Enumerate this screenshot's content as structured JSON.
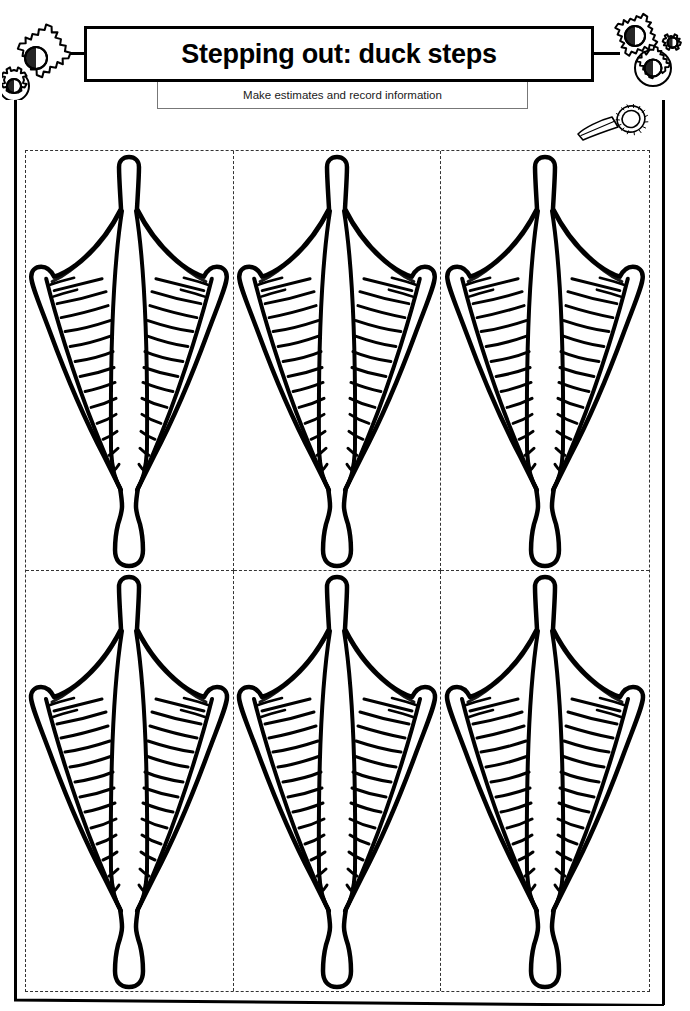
{
  "page": {
    "title": "Stepping out: duck steps",
    "subtitle": "Make estimates and record information",
    "background_color": "#ffffff",
    "ink_color": "#000000",
    "dash_color": "#333333"
  },
  "header": {
    "title": "Stepping out: duck steps",
    "subtitle": "Make estimates and record information",
    "left_decoration": "gear-cluster-icon",
    "right_decoration": "gear-cluster-icon",
    "corner_decoration": "magnifying-glass-icon",
    "left_gear_count": 2,
    "right_gear_count": 3
  },
  "worksheet": {
    "grid": {
      "columns": 3,
      "rows": 2,
      "total_cells": 6,
      "border_style": "dashed",
      "cell_content": "duck-foot-cutout"
    },
    "cells": [
      {
        "id": "cell-1",
        "row": 1,
        "column": 1,
        "shape": "duck-webbed-foot"
      },
      {
        "id": "cell-2",
        "row": 1,
        "column": 2,
        "shape": "duck-webbed-foot"
      },
      {
        "id": "cell-3",
        "row": 1,
        "column": 3,
        "shape": "duck-webbed-foot"
      },
      {
        "id": "cell-4",
        "row": 2,
        "column": 1,
        "shape": "duck-webbed-foot"
      },
      {
        "id": "cell-5",
        "row": 2,
        "column": 2,
        "shape": "duck-webbed-foot"
      },
      {
        "id": "cell-6",
        "row": 2,
        "column": 3,
        "shape": "duck-webbed-foot"
      }
    ]
  }
}
